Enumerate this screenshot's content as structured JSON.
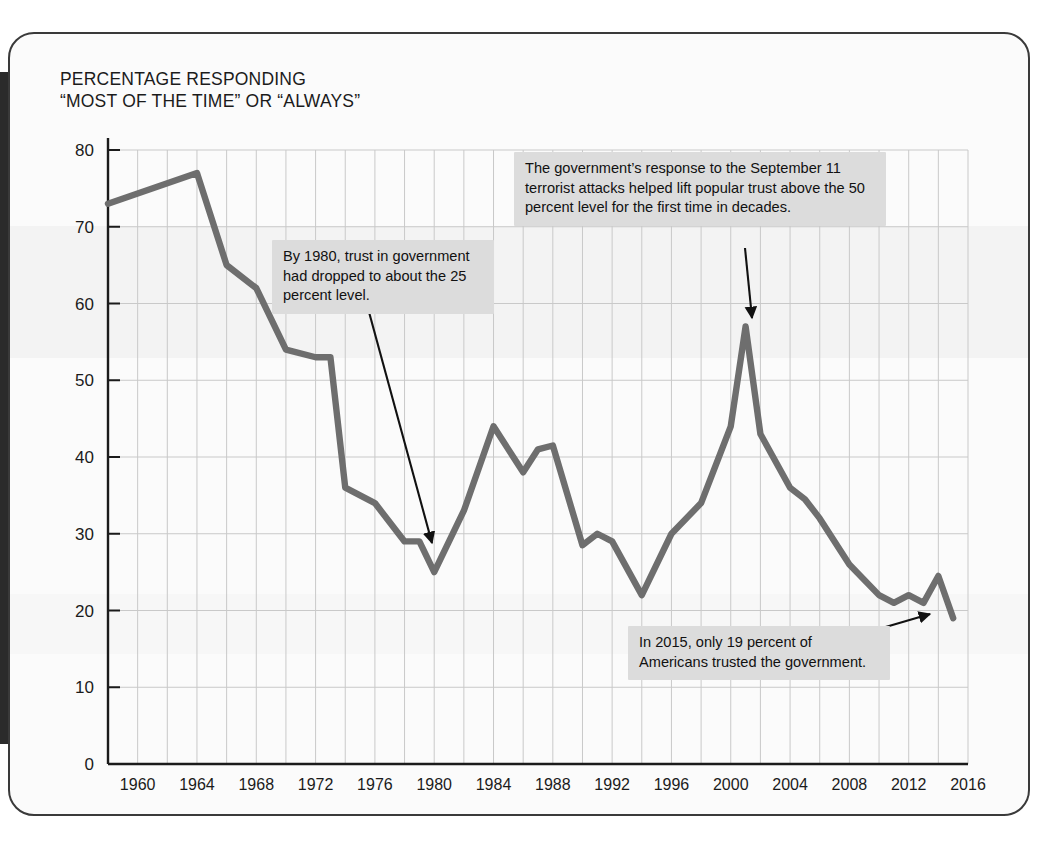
{
  "figure": {
    "title": "PERCENTAGE RESPONDING\n“MOST OF THE TIME” OR “ALWAYS”",
    "line_color": "#6e6e6e",
    "grid_color": "#c9c9c9",
    "axis_color": "#1b1b1b",
    "callout_bg": "#dcdcdc"
  },
  "annotations": {
    "a1980": "By 1980, trust in government had dropped to about the 25 percent level.",
    "a2001": "The government’s response to the September 11 terrorist attacks helped lift popular trust above the 50 percent level for the first time in decades.",
    "a2015": "In 2015, only 19 percent of Americans trusted the government."
  },
  "chart_data": {
    "type": "line",
    "title": "PERCENTAGE RESPONDING “MOST OF THE TIME” OR “ALWAYS”",
    "xlabel": "",
    "ylabel": "",
    "xlim": [
      1958,
      2016
    ],
    "ylim": [
      0,
      80
    ],
    "yticks": [
      0,
      10,
      20,
      30,
      40,
      50,
      60,
      70,
      80
    ],
    "xticks": [
      1960,
      1964,
      1968,
      1972,
      1976,
      1980,
      1984,
      1988,
      1992,
      1996,
      2000,
      2004,
      2008,
      2012,
      2016
    ],
    "grid": true,
    "grid_x_interval": 2,
    "legend": "none",
    "series": [
      {
        "name": "Trust in government (percent)",
        "x": [
          1958,
          1964,
          1966,
          1968,
          1970,
          1972,
          1973,
          1974,
          1976,
          1978,
          1979,
          1980,
          1982,
          1984,
          1986,
          1987,
          1988,
          1990,
          1991,
          1992,
          1994,
          1996,
          1998,
          2000,
          2001,
          2002,
          2004,
          2005,
          2006,
          2008,
          2010,
          2011,
          2012,
          2013,
          2014,
          2015
        ],
        "values": [
          73,
          77,
          65,
          62,
          54,
          53,
          53,
          36,
          34,
          29,
          29,
          25,
          33,
          44,
          38,
          41,
          41.5,
          28.5,
          30,
          29,
          22,
          30,
          34,
          44,
          57,
          43,
          36,
          34.5,
          32,
          26,
          22,
          21,
          22,
          21,
          24.5,
          19
        ]
      }
    ],
    "annotations": [
      {
        "text": "By 1980, trust in government had dropped to about the 25 percent level.",
        "points_to_x": 1980,
        "points_to_y": 25
      },
      {
        "text": "The government’s response to the September 11 terrorist attacks helped lift popular trust above the 50 percent level for the first time in decades.",
        "points_to_x": 2001,
        "points_to_y": 57
      },
      {
        "text": "In 2015, only 19 percent of Americans trusted the government.",
        "points_to_x": 2015,
        "points_to_y": 19
      }
    ]
  }
}
